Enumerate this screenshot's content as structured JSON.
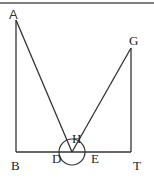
{
  "diagram": {
    "type": "geometry-figure",
    "colors": {
      "stroke": "#333333",
      "border": "#555555",
      "background": "#ffffff"
    },
    "points": {
      "A": {
        "label": "A",
        "x": 16,
        "y": 20
      },
      "B": {
        "label": "B",
        "x": 16,
        "y": 152
      },
      "D": {
        "label": "D",
        "x": 72,
        "y": 152
      },
      "E": {
        "label": "E",
        "x": 90,
        "y": 152
      },
      "H": {
        "label": "H",
        "x": 72,
        "y": 139
      },
      "G": {
        "label": "G",
        "x": 131,
        "y": 48
      },
      "T": {
        "label": "T",
        "x": 131,
        "y": 152
      }
    },
    "segments": [
      [
        "A",
        "B"
      ],
      [
        "B",
        "T"
      ],
      [
        "T",
        "G"
      ],
      [
        "A",
        "D"
      ],
      [
        "D",
        "G"
      ]
    ],
    "circle": {
      "center": "D",
      "radius": 13
    },
    "labels": {
      "A": "A",
      "B": "B",
      "D": "D",
      "E": "E",
      "H": "H",
      "G": "G",
      "T": "T"
    }
  }
}
